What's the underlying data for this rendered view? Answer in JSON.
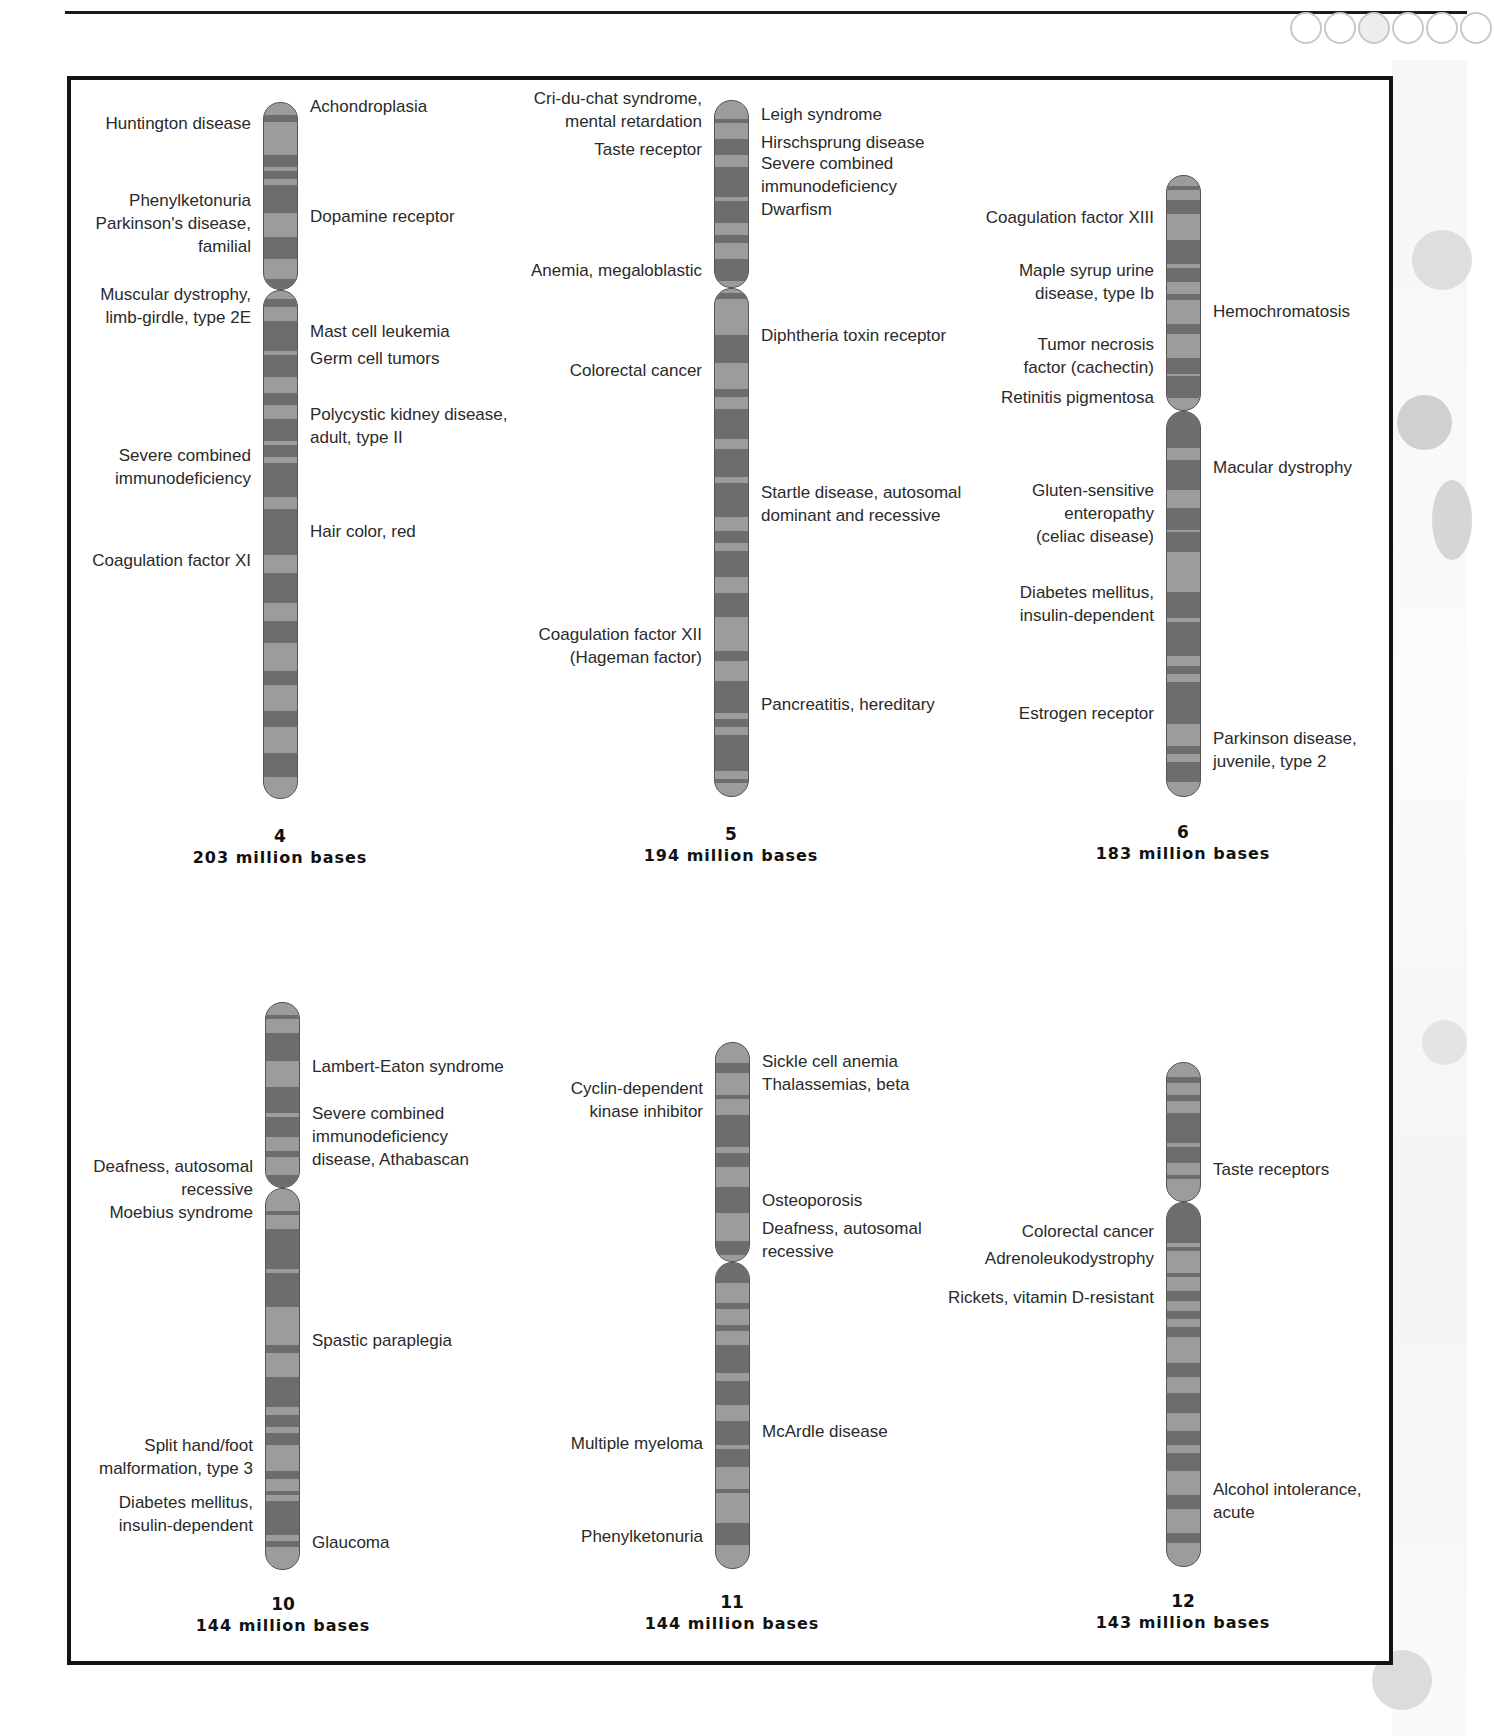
{
  "decor": {
    "circle_count": 6
  },
  "chromosomes": [
    {
      "id": "chr4",
      "number": "4",
      "bases": "203 million bases",
      "left_labels": [
        {
          "text": "Huntington disease",
          "y": 123
        },
        {
          "text": "Phenylketonuria",
          "y": 200
        },
        {
          "text": "Parkinson's disease,",
          "y": 223
        },
        {
          "text": "familial",
          "y": 246
        },
        {
          "text": "Muscular dystrophy,",
          "y": 294
        },
        {
          "text": "limb-girdle, type 2E",
          "y": 317
        },
        {
          "text": "Severe combined",
          "y": 455
        },
        {
          "text": "immunodeficiency",
          "y": 478
        },
        {
          "text": "Coagulation factor XI",
          "y": 560
        }
      ],
      "right_labels": [
        {
          "text": "Achondroplasia",
          "y": 106
        },
        {
          "text": "Dopamine receptor",
          "y": 216
        },
        {
          "text": "Mast cell leukemia",
          "y": 331
        },
        {
          "text": "Germ cell tumors",
          "y": 358
        },
        {
          "text": "Polycystic kidney disease,",
          "y": 414
        },
        {
          "text": "adult, type II",
          "y": 437
        },
        {
          "text": "Hair color, red",
          "y": 531
        }
      ]
    },
    {
      "id": "chr5",
      "number": "5",
      "bases": "194 million bases",
      "left_labels": [
        {
          "text": "Cri-du-chat syndrome,",
          "y": 98
        },
        {
          "text": "mental retardation",
          "y": 121
        },
        {
          "text": "Taste receptor",
          "y": 149
        },
        {
          "text": "Anemia, megaloblastic",
          "y": 270
        },
        {
          "text": "Colorectal cancer",
          "y": 370
        },
        {
          "text": "Coagulation factor XII",
          "y": 634
        },
        {
          "text": "(Hageman factor)",
          "y": 657
        }
      ],
      "right_labels": [
        {
          "text": "Leigh syndrome",
          "y": 114
        },
        {
          "text": "Hirschsprung disease",
          "y": 142
        },
        {
          "text": "Severe combined",
          "y": 163
        },
        {
          "text": "immunodeficiency",
          "y": 186
        },
        {
          "text": "Dwarfism",
          "y": 209
        },
        {
          "text": "Diphtheria toxin receptor",
          "y": 335
        },
        {
          "text": "Startle disease, autosomal",
          "y": 492
        },
        {
          "text": "dominant and recessive",
          "y": 515
        },
        {
          "text": "Pancreatitis, hereditary",
          "y": 704
        }
      ]
    },
    {
      "id": "chr6",
      "number": "6",
      "bases": "183 million bases",
      "left_labels": [
        {
          "text": "Coagulation factor XIII",
          "y": 217
        },
        {
          "text": "Maple syrup urine",
          "y": 270
        },
        {
          "text": "disease, type Ib",
          "y": 293
        },
        {
          "text": "Tumor necrosis",
          "y": 344
        },
        {
          "text": "factor (cachectin)",
          "y": 367
        },
        {
          "text": "Retinitis pigmentosa",
          "y": 397
        },
        {
          "text": "Gluten-sensitive",
          "y": 490
        },
        {
          "text": "enteropathy",
          "y": 513
        },
        {
          "text": "(celiac disease)",
          "y": 536
        },
        {
          "text": "Diabetes mellitus,",
          "y": 592
        },
        {
          "text": "insulin-dependent",
          "y": 615
        },
        {
          "text": "Estrogen receptor",
          "y": 713
        }
      ],
      "right_labels": [
        {
          "text": "Hemochromatosis",
          "y": 311
        },
        {
          "text": "Macular dystrophy",
          "y": 467
        },
        {
          "text": "Parkinson disease,",
          "y": 738
        },
        {
          "text": "juvenile, type 2",
          "y": 761
        }
      ]
    },
    {
      "id": "chr10",
      "number": "10",
      "bases": "144 million bases",
      "left_labels": [
        {
          "text": "Deafness, autosomal",
          "y": 1166
        },
        {
          "text": "recessive",
          "y": 1189
        },
        {
          "text": "Moebius syndrome",
          "y": 1212
        },
        {
          "text": "Split hand/foot",
          "y": 1445
        },
        {
          "text": "malformation, type 3",
          "y": 1468
        },
        {
          "text": "Diabetes mellitus,",
          "y": 1502
        },
        {
          "text": "insulin-dependent",
          "y": 1525
        }
      ],
      "right_labels": [
        {
          "text": "Lambert-Eaton syndrome",
          "y": 1066
        },
        {
          "text": "Severe combined",
          "y": 1113
        },
        {
          "text": "immunodeficiency",
          "y": 1136
        },
        {
          "text": "disease, Athabascan",
          "y": 1159
        },
        {
          "text": "Spastic paraplegia",
          "y": 1340
        },
        {
          "text": "Glaucoma",
          "y": 1542
        }
      ]
    },
    {
      "id": "chr11",
      "number": "11",
      "bases": "144 million bases",
      "left_labels": [
        {
          "text": "Cyclin-dependent",
          "y": 1088
        },
        {
          "text": "kinase inhibitor",
          "y": 1111
        },
        {
          "text": "Multiple myeloma",
          "y": 1443
        },
        {
          "text": "Phenylketonuria",
          "y": 1536
        }
      ],
      "right_labels": [
        {
          "text": "Sickle cell anemia",
          "y": 1061
        },
        {
          "text": "Thalassemias, beta",
          "y": 1084
        },
        {
          "text": "Osteoporosis",
          "y": 1200
        },
        {
          "text": "Deafness, autosomal",
          "y": 1228
        },
        {
          "text": "recessive",
          "y": 1251
        },
        {
          "text": "McArdle disease",
          "y": 1431
        }
      ]
    },
    {
      "id": "chr12",
      "number": "12",
      "bases": "143 million bases",
      "left_labels": [
        {
          "text": "Colorectal cancer",
          "y": 1231
        },
        {
          "text": "Adrenoleukodystrophy",
          "y": 1258
        },
        {
          "text": "Rickets, vitamin D-resistant",
          "y": 1297
        }
      ],
      "right_labels": [
        {
          "text": "Taste receptors",
          "y": 1169
        },
        {
          "text": "Alcohol intolerance,",
          "y": 1489
        },
        {
          "text": "acute",
          "y": 1512
        }
      ]
    }
  ]
}
